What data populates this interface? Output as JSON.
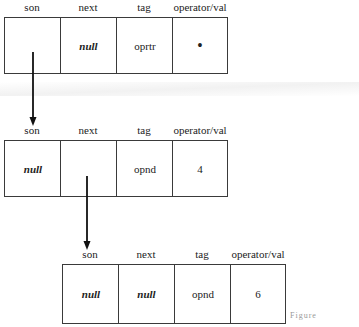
{
  "diagram": {
    "type": "linked-node-structure",
    "field_labels": [
      "son",
      "next",
      "tag",
      "operator/val"
    ],
    "nodes": [
      {
        "id": "node1",
        "fields": {
          "son": "",
          "next": "null",
          "tag": "oprtr",
          "operator_val": "•"
        }
      },
      {
        "id": "node2",
        "fields": {
          "son": "null",
          "next": "",
          "tag": "opnd",
          "operator_val": "4"
        }
      },
      {
        "id": "node3",
        "fields": {
          "son": "null",
          "next": "null",
          "tag": "opnd",
          "operator_val": "6"
        }
      }
    ],
    "edges": [
      {
        "from": "node1.son",
        "to": "node2"
      },
      {
        "from": "node2.next",
        "to": "node3"
      }
    ],
    "caption_partial": "Figure ..."
  }
}
